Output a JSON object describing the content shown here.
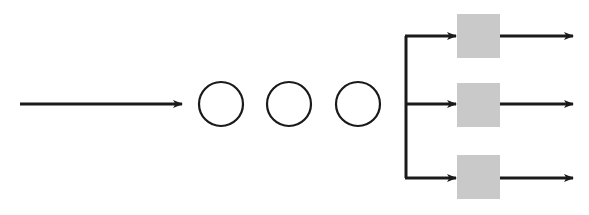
{
  "diagram": {
    "colors": {
      "stroke": "#1a1a1a",
      "block_fill": "#c9c9c9",
      "background": "#ffffff"
    },
    "input": {
      "kind": "arrow",
      "label": ""
    },
    "nodes": [
      {
        "id": "node-1",
        "shape": "circle",
        "label": ""
      },
      {
        "id": "node-2",
        "shape": "circle",
        "label": ""
      },
      {
        "id": "node-3",
        "shape": "circle",
        "label": ""
      }
    ],
    "branches": [
      {
        "id": "branch-1",
        "block": {
          "shape": "square",
          "label": ""
        },
        "output_label": ""
      },
      {
        "id": "branch-2",
        "block": {
          "shape": "square",
          "label": ""
        },
        "output_label": ""
      },
      {
        "id": "branch-3",
        "block": {
          "shape": "square",
          "label": ""
        },
        "output_label": ""
      }
    ]
  }
}
